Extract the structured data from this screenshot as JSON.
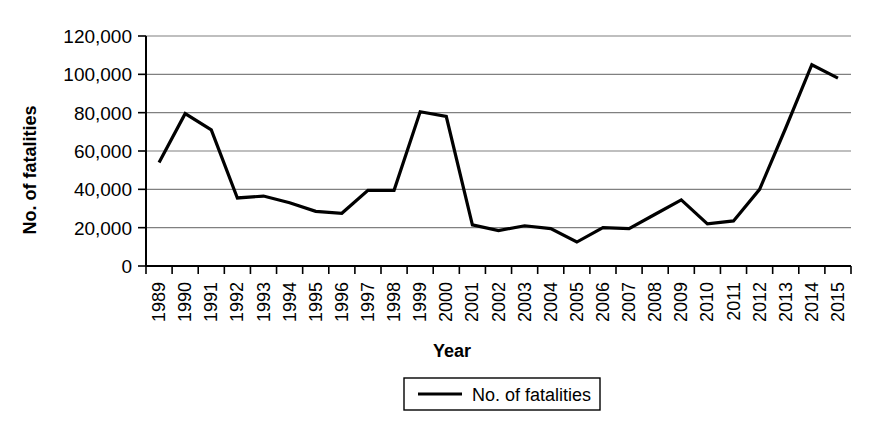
{
  "chart_data": {
    "type": "line",
    "title": "",
    "xlabel": "Year",
    "ylabel": "No. of fatalities",
    "legend_position": "bottom",
    "grid": true,
    "ylim": [
      0,
      120000
    ],
    "ytick_labels": [
      "120,000",
      "100,000",
      "80,000",
      "60,000",
      "40,000",
      "20,000",
      "0"
    ],
    "ytick_values": [
      120000,
      100000,
      80000,
      60000,
      40000,
      20000,
      0
    ],
    "categories": [
      "1989",
      "1990",
      "1991",
      "1992",
      "1993",
      "1994",
      "1995",
      "1996",
      "1997",
      "1998",
      "1999",
      "2000",
      "2001",
      "2002",
      "2003",
      "2004",
      "2005",
      "2006",
      "2007",
      "2008",
      "2009",
      "2010",
      "2011",
      "2012",
      "2013",
      "2014",
      "2015"
    ],
    "series": [
      {
        "name": "No. of fatalities",
        "color": "#000000",
        "values": [
          54000,
          79500,
          71000,
          35500,
          36500,
          33000,
          28500,
          27500,
          39500,
          39500,
          80500,
          78000,
          21500,
          18500,
          21000,
          19500,
          12500,
          20000,
          19500,
          27000,
          34500,
          22000,
          23500,
          40000,
          72000,
          105000,
          98000
        ]
      }
    ],
    "legend_entries": [
      {
        "label": "No. of fatalities",
        "marker": "line",
        "color": "#000000"
      }
    ]
  }
}
